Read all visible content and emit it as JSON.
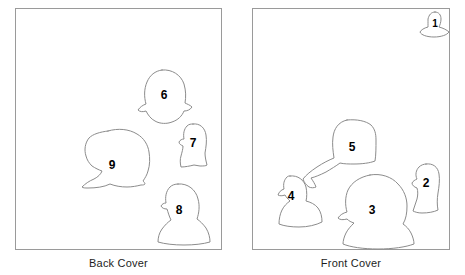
{
  "figure": {
    "type": "photo-key-diagram",
    "background_color": "#ffffff",
    "outline_color": "#8c8c8c",
    "panel_border_color": "#9a9a9a",
    "label_color": "#000000"
  },
  "panels": [
    {
      "id": "back-cover",
      "caption": "Back Cover",
      "figure_numbers": [
        "6",
        "7",
        "8",
        "9"
      ]
    },
    {
      "id": "front-cover",
      "caption": "Front Cover",
      "figure_numbers": [
        "1",
        "2",
        "3",
        "4",
        "5"
      ]
    }
  ],
  "heads": {
    "back": [
      {
        "number": "6",
        "cx": 164,
        "cy": 96
      },
      {
        "number": "7",
        "cx": 193,
        "cy": 144
      },
      {
        "number": "9",
        "cx": 112,
        "cy": 166
      },
      {
        "number": "8",
        "cx": 179,
        "cy": 211
      }
    ],
    "front": [
      {
        "number": "1",
        "cx": 435,
        "cy": 24
      },
      {
        "number": "5",
        "cx": 352,
        "cy": 148
      },
      {
        "number": "4",
        "cx": 291,
        "cy": 197
      },
      {
        "number": "3",
        "cx": 372,
        "cy": 211
      },
      {
        "number": "2",
        "cx": 426,
        "cy": 184
      }
    ]
  }
}
